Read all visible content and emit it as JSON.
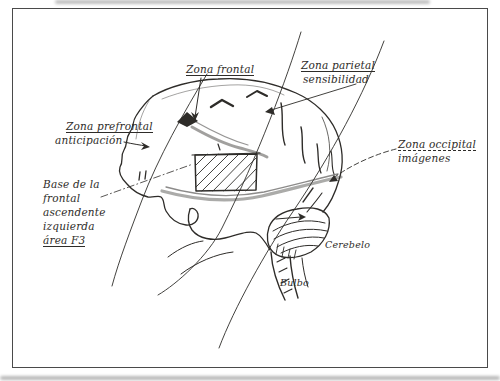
{
  "figure": {
    "colors": {
      "ink": "#2e2c29",
      "paper": "#ffffff",
      "frame": "#4a4a4a"
    },
    "labels": {
      "zona_frontal": "Zona frontal",
      "zona_parietal_line1": "Zona parietal",
      "zona_parietal_line2": "sensibilidad",
      "zona_prefrontal_line1": "Zona prefrontal",
      "zona_prefrontal_line2": "anticipación",
      "base_frontal_line1": "Base de la",
      "base_frontal_line2": "frontal",
      "base_frontal_line3": "ascendente",
      "base_frontal_line4": "izquierda",
      "base_frontal_line5": "área F3",
      "zona_occipital_line1": "Zona occipital",
      "zona_occipital_line2": "imágenes",
      "cerebelo": "Cerebelo",
      "bulbo": "Bulbo"
    }
  }
}
